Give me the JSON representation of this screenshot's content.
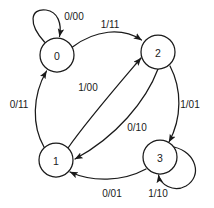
{
  "diagram": {
    "type": "state-transition-diagram",
    "width": 214,
    "height": 208,
    "background_color": "#ffffff",
    "stroke_color": "#1a1a1a",
    "states": [
      {
        "id": "s0",
        "label": "0",
        "cx": 57,
        "cy": 55,
        "r": 17
      },
      {
        "id": "s2",
        "label": "2",
        "cx": 158,
        "cy": 52,
        "r": 17
      },
      {
        "id": "s1",
        "label": "1",
        "cx": 56,
        "cy": 160,
        "r": 17
      },
      {
        "id": "s3",
        "label": "3",
        "cx": 160,
        "cy": 157,
        "r": 17
      }
    ],
    "transitions": [
      {
        "id": "t-0-0",
        "from": "0",
        "to": "0",
        "label": "0/00",
        "kind": "self-loop",
        "label_x": 74,
        "label_y": 16
      },
      {
        "id": "t-0-2",
        "from": "0",
        "to": "2",
        "label": "1/11",
        "kind": "arc",
        "label_x": 110,
        "label_y": 24
      },
      {
        "id": "t-1-0",
        "from": "1",
        "to": "0",
        "label": "0/11",
        "kind": "arc",
        "label_x": 19,
        "label_y": 104
      },
      {
        "id": "t-1-2",
        "from": "1",
        "to": "2",
        "label": "1/00",
        "kind": "arc",
        "label_x": 88,
        "label_y": 87
      },
      {
        "id": "t-2-1",
        "from": "2",
        "to": "1",
        "label": "0/10",
        "kind": "arc",
        "label_x": 137,
        "label_y": 127
      },
      {
        "id": "t-2-3",
        "from": "2",
        "to": "3",
        "label": "1/01",
        "kind": "arc",
        "label_x": 190,
        "label_y": 104
      },
      {
        "id": "t-3-1",
        "from": "3",
        "to": "1",
        "label": "0/01",
        "kind": "arc",
        "label_x": 112,
        "label_y": 193
      },
      {
        "id": "t-3-3",
        "from": "3",
        "to": "3",
        "label": "1/10",
        "kind": "self-loop",
        "label_x": 158,
        "label_y": 193
      }
    ]
  }
}
